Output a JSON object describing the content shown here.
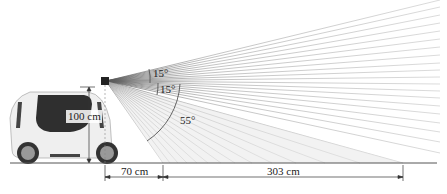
{
  "diagram": {
    "labels": {
      "sensor_height": "100 cm",
      "blind_distance": "70 cm",
      "range_distance": "303 cm",
      "angle_upper": "15°",
      "angle_middle": "15°",
      "angle_lower": "55°"
    },
    "colors": {
      "ray": "#9a9a9a",
      "ground": "#555555",
      "arc": "#555555",
      "car_body": "#eeeeee",
      "car_glass": "#333333"
    }
  }
}
